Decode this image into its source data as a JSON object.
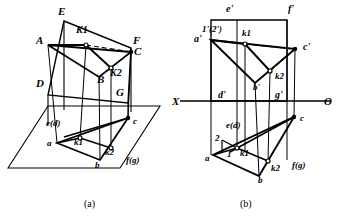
{
  "figure": {
    "title_absent": true,
    "captions": [
      {
        "id": "cap-a",
        "text": "(a)",
        "x": 84,
        "y": 207
      },
      {
        "id": "cap-b",
        "text": "(b)",
        "x": 240,
        "y": 207
      }
    ]
  },
  "diagram_a": {
    "name": "pictorial-3d-view",
    "labels": [
      {
        "id": "E",
        "text": "E",
        "x": 58,
        "y": 15,
        "size": 11
      },
      {
        "id": "A",
        "text": "A",
        "x": 36,
        "y": 44,
        "size": 11
      },
      {
        "id": "K1",
        "text": "K1",
        "x": 76,
        "y": 33,
        "size": 10
      },
      {
        "id": "F",
        "text": "F",
        "x": 133,
        "y": 44,
        "size": 11
      },
      {
        "id": "C",
        "text": "C",
        "x": 134,
        "y": 55,
        "size": 11
      },
      {
        "id": "K2",
        "text": "K2",
        "x": 110,
        "y": 76,
        "size": 10
      },
      {
        "id": "B",
        "text": "B",
        "x": 97,
        "y": 83,
        "size": 11
      },
      {
        "id": "D",
        "text": "D",
        "x": 36,
        "y": 87,
        "size": 11
      },
      {
        "id": "G",
        "text": "G",
        "x": 116,
        "y": 96,
        "size": 11
      },
      {
        "id": "ed",
        "text": "e(d)",
        "x": 46,
        "y": 126,
        "size": 9
      },
      {
        "id": "c",
        "text": "c",
        "x": 133,
        "y": 124,
        "size": 9
      },
      {
        "id": "a",
        "text": "a",
        "x": 47,
        "y": 146,
        "size": 9
      },
      {
        "id": "k1",
        "text": "k1",
        "x": 74,
        "y": 145,
        "size": 9
      },
      {
        "id": "k2",
        "text": "k2",
        "x": 105,
        "y": 155,
        "size": 9
      },
      {
        "id": "b",
        "text": "b",
        "x": 95,
        "y": 168,
        "size": 9
      },
      {
        "id": "fg",
        "text": "f(g)",
        "x": 126,
        "y": 163,
        "size": 9
      }
    ],
    "points": {
      "E": [
        64,
        21
      ],
      "F": [
        131,
        48
      ],
      "D": [
        48,
        95
      ],
      "G": [
        128,
        103
      ],
      "A": [
        48,
        45
      ],
      "B": [
        99,
        77
      ],
      "C": [
        131,
        52
      ],
      "K1": [
        86,
        45
      ],
      "K2": [
        111,
        68
      ],
      "a": [
        57,
        143
      ],
      "b": [
        100,
        160
      ],
      "c": [
        128,
        118
      ],
      "e_d": [
        64,
        110
      ],
      "f_g": [
        128,
        110
      ],
      "k1p": [
        80,
        138
      ],
      "k2p": [
        111,
        148
      ]
    },
    "ground_plane": [
      [
        8,
        168
      ],
      [
        48,
        106
      ],
      [
        160,
        106
      ],
      [
        120,
        168
      ]
    ]
  },
  "diagram_b": {
    "name": "orthographic-projection-view",
    "axis": {
      "x_label": "X",
      "o_label": "O",
      "y": 101,
      "x1": 180,
      "x2": 330,
      "x_label_pos": [
        172,
        105
      ],
      "o_label_pos": [
        324,
        105
      ]
    },
    "labels": [
      {
        "id": "ep",
        "text": "e'",
        "x": 226,
        "y": 12,
        "size": 10
      },
      {
        "id": "fp",
        "text": "f'",
        "x": 288,
        "y": 12,
        "size": 10
      },
      {
        "id": "12p",
        "text": "1'(2')",
        "x": 202,
        "y": 32,
        "size": 9
      },
      {
        "id": "ap",
        "text": "a'",
        "x": 194,
        "y": 42,
        "size": 10
      },
      {
        "id": "k1p",
        "text": "k1",
        "x": 242,
        "y": 36,
        "size": 9
      },
      {
        "id": "cp",
        "text": "c'",
        "x": 303,
        "y": 50,
        "size": 10
      },
      {
        "id": "k2p",
        "text": "k2",
        "x": 275,
        "y": 79,
        "size": 9
      },
      {
        "id": "bp",
        "text": "b'",
        "x": 253,
        "y": 90,
        "size": 9
      },
      {
        "id": "dp",
        "text": "d'",
        "x": 218,
        "y": 98,
        "size": 10
      },
      {
        "id": "gp",
        "text": "g'",
        "x": 275,
        "y": 98,
        "size": 10
      },
      {
        "id": "ed",
        "text": "e(d)",
        "x": 226,
        "y": 128,
        "size": 9
      },
      {
        "id": "two",
        "text": "2",
        "x": 215,
        "y": 141,
        "size": 9
      },
      {
        "id": "c",
        "text": "c",
        "x": 300,
        "y": 121,
        "size": 9
      },
      {
        "id": "one",
        "text": "1",
        "x": 227,
        "y": 157,
        "size": 9
      },
      {
        "id": "k1",
        "text": "k1",
        "x": 240,
        "y": 156,
        "size": 9
      },
      {
        "id": "a",
        "text": "a",
        "x": 205,
        "y": 161,
        "size": 9
      },
      {
        "id": "k2",
        "text": "k2",
        "x": 271,
        "y": 171,
        "size": 9
      },
      {
        "id": "fg",
        "text": "f(g)",
        "x": 292,
        "y": 168,
        "size": 9
      },
      {
        "id": "b",
        "text": "b",
        "x": 258,
        "y": 183,
        "size": 9
      }
    ],
    "front_view": {
      "rect": [
        [
          211,
          20
        ],
        [
          287,
          20
        ],
        [
          287,
          101
        ],
        [
          211,
          101
        ]
      ],
      "a_p": [
        211,
        40
      ],
      "b_p": [
        255,
        83
      ],
      "c_p": [
        295,
        49
      ],
      "k1_p": [
        245,
        44
      ],
      "k2_p": [
        270,
        71
      ]
    },
    "top_view": {
      "a": [
        213,
        155
      ],
      "b": [
        259,
        176
      ],
      "c": [
        294,
        117
      ],
      "e_d": [
        237,
        143
      ],
      "f_g": [
        287,
        143
      ],
      "k1": [
        237,
        148
      ],
      "k2": [
        268,
        161
      ]
    }
  },
  "style": {
    "stroke": "#000000",
    "background": "#ffffff"
  }
}
